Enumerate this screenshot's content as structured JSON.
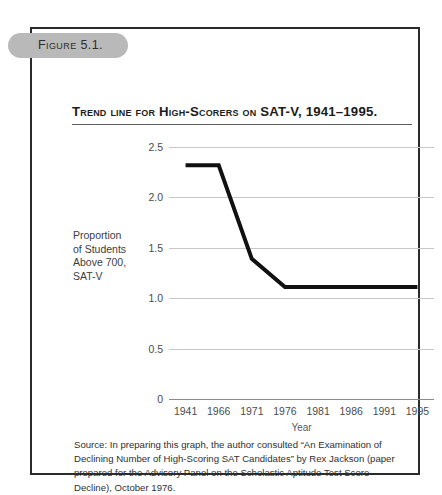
{
  "figure": {
    "number_label": "Figure 5.1.",
    "title": "Trend line for High-Scorers on SAT-V, 1941–1995.",
    "source_note": "Source: In preparing this graph, the author consulted “An Examination of Declining Number of High-Scoring SAT Candidates” by Rex Jackson (paper prepared for the Advisory Panel on the Scholastic Aptitude Test Score Decline), October 1976."
  },
  "axis": {
    "y_title_lines": [
      "Proportion",
      "of Students",
      "Above 700,",
      "SAT-V"
    ],
    "y_title_text": "Proportion of Students Above 700, SAT-V",
    "x_title": "Year"
  },
  "colors": {
    "line": "#111111",
    "gridline": "#c8c8c8",
    "axis": "#8a8a8a",
    "frame": "#2b2b2b",
    "pill": "#b9b9b9",
    "text": "#3d3d3d"
  },
  "chart_data": {
    "type": "line",
    "title": "Trend line for High-Scorers on SAT-V, 1941–1995.",
    "xlabel": "Year",
    "ylabel": "Proportion of Students Above 700, SAT-V",
    "x": [
      1941,
      1966,
      1971,
      1976,
      1981,
      1986,
      1991,
      1995
    ],
    "xtick_labels": [
      "1941",
      "1966",
      "1971",
      "1976",
      "1981",
      "1986",
      "1991",
      "1995"
    ],
    "values": [
      2.32,
      2.32,
      1.39,
      1.11,
      1.11,
      1.11,
      1.11,
      1.11
    ],
    "series": [
      {
        "name": "Proportion of students above 700, SAT-V",
        "values": [
          2.32,
          2.32,
          1.39,
          1.11,
          1.11,
          1.11,
          1.11,
          1.11
        ]
      }
    ],
    "ylim": [
      0,
      2.5
    ],
    "ytick_values": [
      2.5,
      2.0,
      1.5,
      1.0,
      0.5,
      0
    ],
    "ytick_labels": [
      "2.5",
      "2.0",
      "1.5",
      "1.0",
      "0.5",
      "0"
    ],
    "grid": true,
    "legend": false,
    "legend_position": "none",
    "markers": false,
    "line_width": 4
  }
}
